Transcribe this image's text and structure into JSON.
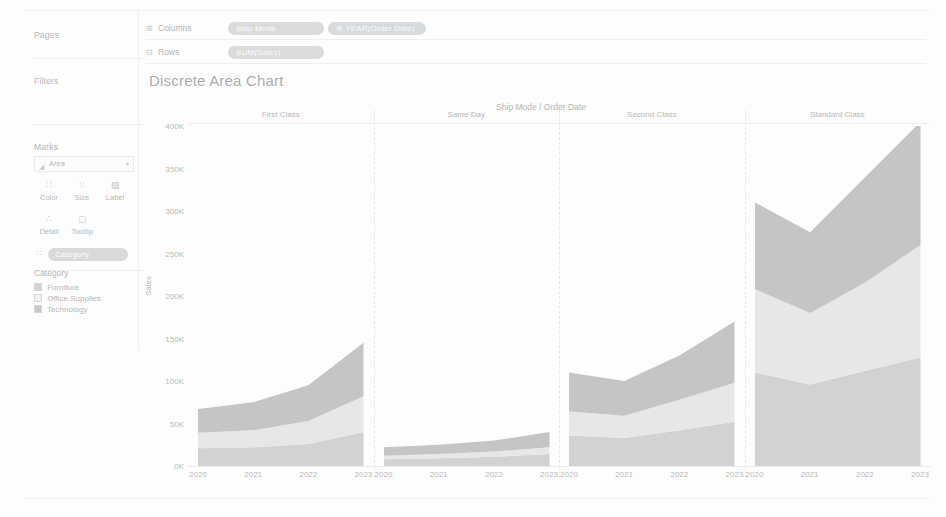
{
  "sidebar": {
    "pages_label": "Pages",
    "filters_label": "Filters",
    "marks_label": "Marks",
    "marks": {
      "type_icon": "area-mark-icon",
      "type_value": "Area",
      "caret": "▾",
      "buttons": [
        {
          "name": "color",
          "label": "Color",
          "glyph": "∷"
        },
        {
          "name": "size",
          "label": "Size",
          "glyph": "⁙"
        },
        {
          "name": "label",
          "label": "Label",
          "glyph": "▧"
        },
        {
          "name": "detail",
          "label": "Detail",
          "glyph": "∴"
        },
        {
          "name": "tooltip",
          "label": "Tooltip",
          "glyph": "▢"
        }
      ],
      "detail_pill": {
        "icon": "∷",
        "label": "Category"
      }
    }
  },
  "legend": {
    "title": "Category",
    "items": [
      {
        "label": "Furniture",
        "color": "#c9c9c9"
      },
      {
        "label": "Office Supplies",
        "color": "#e2e2e2"
      },
      {
        "label": "Technology",
        "color": "#b9b9b9"
      }
    ]
  },
  "shelves": {
    "columns": {
      "label": "Columns",
      "icon": "⊞",
      "pills": [
        {
          "text": "Ship Mode",
          "kind": "dim"
        },
        {
          "text": "⊕ YEAR(Order Date)",
          "kind": "dim"
        }
      ]
    },
    "rows": {
      "label": "Rows",
      "icon": "⊟",
      "pills": [
        {
          "text": "SUM(Sales)",
          "kind": "mea"
        }
      ]
    }
  },
  "view": {
    "title": "Discrete Area Chart",
    "column_field_label": "Ship Mode / Order Date"
  },
  "chart_data": {
    "type": "area",
    "stacked": true,
    "title": "Discrete Area Chart",
    "xlabel": "Ship Mode / Order Date",
    "ylabel": "Sales",
    "ylim": [
      0,
      400000
    ],
    "yticks": [
      0,
      50000,
      100000,
      150000,
      200000,
      250000,
      300000,
      350000,
      400000
    ],
    "ytick_labels": [
      "0K",
      "50K",
      "100K",
      "150K",
      "200K",
      "250K",
      "300K",
      "350K",
      "400K"
    ],
    "grid": false,
    "legend": "left-sidebar",
    "x": [
      "2020",
      "2021",
      "2022",
      "2023"
    ],
    "panels": [
      {
        "name": "First Class",
        "series": [
          {
            "name": "Furniture",
            "color": "#c9c9c9",
            "values": [
              21000,
              22000,
              26000,
              40000
            ]
          },
          {
            "name": "Office Supplies",
            "color": "#e2e2e2",
            "values": [
              18000,
              20000,
              27000,
              42000
            ]
          },
          {
            "name": "Technology",
            "color": "#b9b9b9",
            "values": [
              28000,
              33000,
              42000,
              63000
            ]
          }
        ],
        "totals": [
          67000,
          75000,
          95000,
          145000
        ]
      },
      {
        "name": "Same Day",
        "series": [
          {
            "name": "Furniture",
            "color": "#c9c9c9",
            "values": [
              8000,
              9000,
              11000,
              14000
            ]
          },
          {
            "name": "Office Supplies",
            "color": "#e2e2e2",
            "values": [
              4000,
              5000,
              6000,
              8000
            ]
          },
          {
            "name": "Technology",
            "color": "#b9b9b9",
            "values": [
              10000,
              11000,
              13000,
              18000
            ]
          }
        ],
        "totals": [
          22000,
          25000,
          30000,
          40000
        ]
      },
      {
        "name": "Second Class",
        "series": [
          {
            "name": "Furniture",
            "color": "#c9c9c9",
            "values": [
              36000,
              33000,
              42000,
              52000
            ]
          },
          {
            "name": "Office Supplies",
            "color": "#e2e2e2",
            "values": [
              28000,
              26000,
              36000,
              46000
            ]
          },
          {
            "name": "Technology",
            "color": "#b9b9b9",
            "values": [
              46000,
              41000,
              52000,
              72000
            ]
          }
        ],
        "totals": [
          110000,
          100000,
          130000,
          170000
        ]
      },
      {
        "name": "Standard Class",
        "series": [
          {
            "name": "Furniture",
            "color": "#c9c9c9",
            "values": [
              110000,
              96000,
              112000,
              128000
            ]
          },
          {
            "name": "Office Supplies",
            "color": "#e2e2e2",
            "values": [
              98000,
              84000,
              104000,
              132000
            ]
          },
          {
            "name": "Technology",
            "color": "#b9b9b9",
            "values": [
              102000,
              95000,
              124000,
              145000
            ]
          }
        ],
        "totals": [
          310000,
          275000,
          340000,
          405000
        ]
      }
    ]
  }
}
